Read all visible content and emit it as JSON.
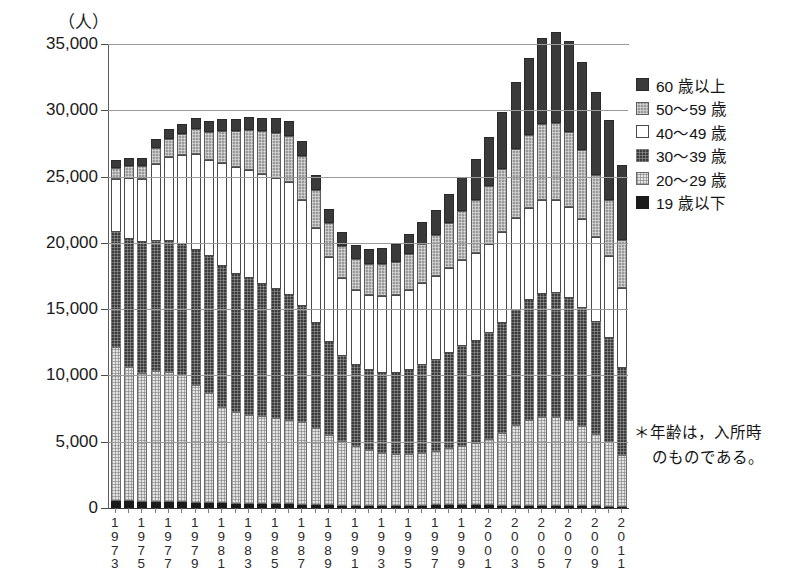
{
  "chart_data": {
    "type": "bar",
    "subtype": "stacked-vertical",
    "title": "",
    "unit_label": "（人）",
    "xlabel": "",
    "ylabel": "",
    "ylim": [
      0,
      35000
    ],
    "ytick_step": 5000,
    "ytick_labels": [
      "0",
      "5,000",
      "10,000",
      "15,000",
      "20,000",
      "25,000",
      "30,000",
      "35,000"
    ],
    "ytick_values": [
      0,
      5000,
      10000,
      15000,
      20000,
      25000,
      30000,
      35000
    ],
    "grid": true,
    "grid_axis": "y",
    "legend_position": "right",
    "categories": [
      "1973",
      "1974",
      "1975",
      "1976",
      "1977",
      "1978",
      "1979",
      "1980",
      "1981",
      "1982",
      "1983",
      "1984",
      "1985",
      "1986",
      "1987",
      "1988",
      "1989",
      "1990",
      "1991",
      "1992",
      "1993",
      "1994",
      "1995",
      "1996",
      "1997",
      "1998",
      "1999",
      "2000",
      "2001",
      "2002",
      "2003",
      "2004",
      "2005",
      "2006",
      "2007",
      "2008",
      "2009",
      "2010",
      "2011"
    ],
    "xtick_labels_shown": [
      "1973",
      "1975",
      "1977",
      "1979",
      "1981",
      "1983",
      "1985",
      "1987",
      "1989",
      "1991",
      "1993",
      "1995",
      "1997",
      "1999",
      "2001",
      "2003",
      "2005",
      "2007",
      "2009",
      "2011"
    ],
    "series": [
      {
        "name": "19 歳以下",
        "key": "s-19",
        "color": "#1b1b1b",
        "values": [
          600,
          580,
          560,
          540,
          520,
          500,
          470,
          450,
          430,
          410,
          390,
          380,
          370,
          350,
          330,
          300,
          280,
          260,
          250,
          250,
          250,
          250,
          250,
          260,
          270,
          280,
          280,
          280,
          270,
          260,
          250,
          240,
          230,
          220,
          210,
          200,
          190,
          180,
          170
        ]
      },
      {
        "name": "20～29 歳",
        "key": "s-20",
        "color": "#e3e3e3",
        "values": [
          11600,
          10100,
          9700,
          9900,
          9800,
          9600,
          8900,
          8300,
          7300,
          6900,
          6700,
          6600,
          6500,
          6400,
          6200,
          5800,
          5300,
          4900,
          4500,
          4200,
          4000,
          3900,
          3900,
          4000,
          4100,
          4300,
          4500,
          4700,
          5000,
          5500,
          6100,
          6500,
          6700,
          6700,
          6500,
          6100,
          5500,
          4900,
          3900
        ]
      },
      {
        "name": "30～39 歳",
        "key": "s-30",
        "color": "#3c3c3c",
        "values": [
          8700,
          9700,
          9900,
          9800,
          9900,
          9900,
          10200,
          10300,
          10600,
          10400,
          10300,
          10000,
          9700,
          9400,
          8800,
          7900,
          7000,
          6400,
          6100,
          6000,
          6000,
          6100,
          6300,
          6600,
          6900,
          7200,
          7500,
          7700,
          8000,
          8300,
          8700,
          9000,
          9300,
          9400,
          9200,
          8900,
          8400,
          7800,
          6600
        ]
      },
      {
        "name": "40～49 歳",
        "key": "s-40",
        "color": "#ffffff",
        "values": [
          4000,
          4600,
          4700,
          5800,
          6300,
          6700,
          7200,
          7300,
          7800,
          8100,
          8200,
          8300,
          8400,
          8500,
          8000,
          7200,
          6400,
          5900,
          5700,
          5700,
          5800,
          5900,
          6100,
          6200,
          6300,
          6400,
          6500,
          6600,
          6700,
          6800,
          6900,
          7000,
          7100,
          7000,
          6900,
          6700,
          6400,
          6200,
          6000
        ]
      },
      {
        "name": "50～59 歳",
        "key": "s-50",
        "color": "#9a9a9a",
        "values": [
          800,
          900,
          1000,
          1200,
          1400,
          1600,
          1900,
          2100,
          2400,
          2700,
          3000,
          3200,
          3400,
          3500,
          3300,
          2900,
          2600,
          2400,
          2300,
          2300,
          2400,
          2500,
          2700,
          2900,
          3100,
          3400,
          3700,
          4000,
          4400,
          4800,
          5200,
          5500,
          5700,
          5800,
          5600,
          5200,
          4700,
          4200,
          3600
        ]
      },
      {
        "name": "60 歳以上",
        "key": "s-60",
        "color": "#3a3a3a",
        "values": [
          600,
          620,
          640,
          680,
          720,
          760,
          800,
          850,
          900,
          950,
          1000,
          1050,
          1100,
          1150,
          1150,
          1100,
          1050,
          1050,
          1100,
          1150,
          1250,
          1350,
          1500,
          1700,
          1900,
          2200,
          2600,
          3100,
          3700,
          4300,
          5100,
          5800,
          6500,
          6900,
          6900,
          6600,
          6300,
          6100,
          5700
        ]
      }
    ],
    "totals": [
      26300,
      26500,
      26500,
      27920,
      28640,
      29060,
      29470,
      29300,
      29430,
      29460,
      29590,
      29530,
      29470,
      29300,
      27780,
      25200,
      22610,
      20910,
      19950,
      19600,
      19700,
      20000,
      20750,
      21660,
      22570,
      23780,
      25080,
      26380,
      28070,
      29960,
      32250,
      34040,
      35530,
      36020,
      35310,
      33700,
      31490,
      29380,
      25970
    ],
    "footnote": {
      "line1": "＊年齢は，入所時",
      "line2": "のものである。"
    }
  }
}
